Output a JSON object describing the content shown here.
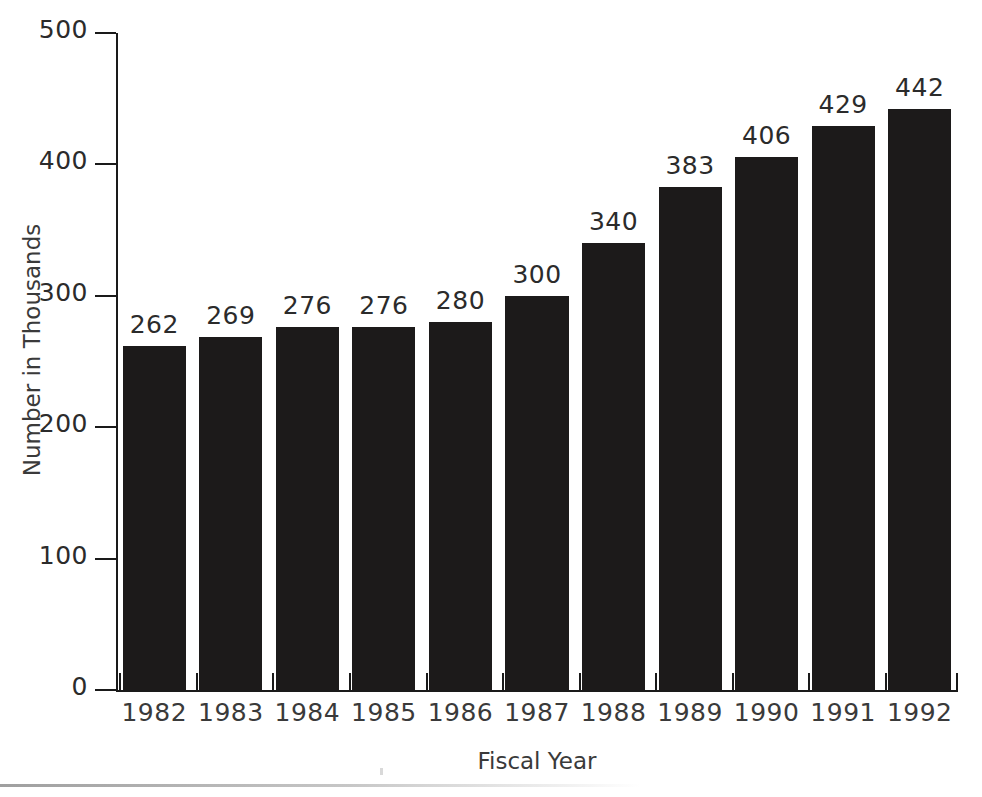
{
  "chart_data": {
    "type": "bar",
    "title": "",
    "subtitle": "",
    "xlabel": "Fiscal Year",
    "ylabel": "Number in Thousands",
    "categories": [
      "1982",
      "1983",
      "1984",
      "1985",
      "1986",
      "1987",
      "1988",
      "1989",
      "1990",
      "1991",
      "1992"
    ],
    "values": [
      262,
      269,
      276,
      276,
      280,
      300,
      340,
      383,
      406,
      429,
      442
    ],
    "value_labels": [
      "262",
      "269",
      "276",
      "276",
      "280",
      "300",
      "340",
      "383",
      "406",
      "429",
      "442"
    ],
    "ylim": [
      0,
      500
    ],
    "ytick_values": [
      0,
      100,
      200,
      300,
      400,
      500
    ],
    "ytick_labels": [
      "0",
      "100",
      "200",
      "300",
      "400",
      "500"
    ],
    "grid": false,
    "legend": null,
    "legend_position": "none",
    "bar_color": "#1c1a1a",
    "axis_color": "#1a1a1a",
    "text_color": "#2b2b2b",
    "background_color": "#ffffff",
    "data_labels_shown": true,
    "annotations": []
  },
  "axes": {
    "y_title": "Number in Thousands",
    "x_title": "Fiscal Year"
  }
}
